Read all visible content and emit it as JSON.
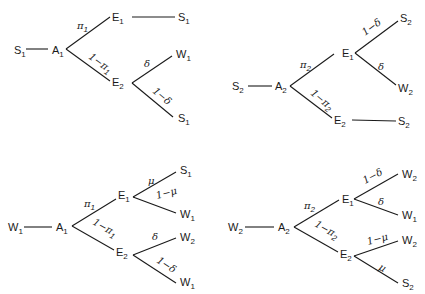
{
  "figure": {
    "trees": [
      {
        "id": "tree-top-left",
        "root": {
          "letter": "S",
          "sub": "1"
        },
        "action": {
          "letter": "A",
          "sub": "1"
        },
        "branch_upper": {
          "label": "π",
          "label_sub": "1",
          "node": {
            "letter": "E",
            "sub": "1"
          }
        },
        "branch_lower": {
          "label": "1−π",
          "label_sub": "1",
          "node": {
            "letter": "E",
            "sub": "2"
          }
        },
        "e1_children": [
          {
            "edge": "",
            "leaf": {
              "letter": "S",
              "sub": "1"
            }
          }
        ],
        "e2_children": [
          {
            "edge": "δ",
            "leaf": {
              "letter": "W",
              "sub": "1"
            }
          },
          {
            "edge": "1−δ",
            "leaf": {
              "letter": "S",
              "sub": "1"
            }
          }
        ]
      },
      {
        "id": "tree-top-right",
        "root": {
          "letter": "S",
          "sub": "2"
        },
        "action": {
          "letter": "A",
          "sub": "2"
        },
        "branch_upper": {
          "label": "π",
          "label_sub": "2",
          "node": {
            "letter": "E",
            "sub": "1"
          }
        },
        "branch_lower": {
          "label": "1−π",
          "label_sub": "2",
          "node": {
            "letter": "E",
            "sub": "2"
          }
        },
        "e1_children": [
          {
            "edge": "1−δ",
            "leaf": {
              "letter": "S",
              "sub": "2"
            }
          },
          {
            "edge": "δ",
            "leaf": {
              "letter": "W",
              "sub": "2"
            }
          }
        ],
        "e2_children": [
          {
            "edge": "",
            "leaf": {
              "letter": "S",
              "sub": "2"
            }
          }
        ]
      },
      {
        "id": "tree-bottom-left",
        "root": {
          "letter": "W",
          "sub": "1"
        },
        "action": {
          "letter": "A",
          "sub": "1"
        },
        "branch_upper": {
          "label": "π",
          "label_sub": "1",
          "node": {
            "letter": "E",
            "sub": "1"
          }
        },
        "branch_lower": {
          "label": "1−π",
          "label_sub": "1",
          "node": {
            "letter": "E",
            "sub": "2"
          }
        },
        "e1_children": [
          {
            "edge": "μ",
            "leaf": {
              "letter": "S",
              "sub": "1"
            }
          },
          {
            "edge": "1−μ",
            "leaf": {
              "letter": "W",
              "sub": "1"
            }
          }
        ],
        "e2_children": [
          {
            "edge": "δ",
            "leaf": {
              "letter": "W",
              "sub": "2"
            }
          },
          {
            "edge": "1−δ",
            "leaf": {
              "letter": "W",
              "sub": "1"
            }
          }
        ]
      },
      {
        "id": "tree-bottom-right",
        "root": {
          "letter": "W",
          "sub": "2"
        },
        "action": {
          "letter": "A",
          "sub": "2"
        },
        "branch_upper": {
          "label": "π",
          "label_sub": "2",
          "node": {
            "letter": "E",
            "sub": "1"
          }
        },
        "branch_lower": {
          "label": "1−π",
          "label_sub": "2",
          "node": {
            "letter": "E",
            "sub": "2"
          }
        },
        "e1_children": [
          {
            "edge": "1−δ",
            "leaf": {
              "letter": "W",
              "sub": "2"
            }
          },
          {
            "edge": "δ",
            "leaf": {
              "letter": "W",
              "sub": "1"
            }
          }
        ],
        "e2_children": [
          {
            "edge": "1−μ",
            "leaf": {
              "letter": "W",
              "sub": "2"
            }
          },
          {
            "edge": "μ",
            "leaf": {
              "letter": "S",
              "sub": "2"
            }
          }
        ]
      }
    ]
  }
}
